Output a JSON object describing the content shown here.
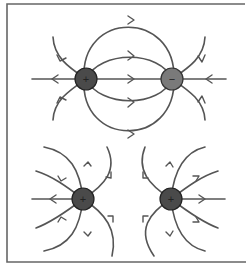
{
  "colors": {
    "line": "#555555",
    "frame": "#666666",
    "positive_charge_fill": "#4a4a4a",
    "negative_charge_fill": "#7a7a7a",
    "charge_stroke": "#222222"
  },
  "panels": [
    {
      "name": "dipole",
      "description": "Opposite charges: field lines run from positive to negative",
      "charges": [
        {
          "sign": "+",
          "label": "+",
          "x": 86,
          "y": 79
        },
        {
          "sign": "-",
          "label": "−",
          "x": 172,
          "y": 79
        }
      ]
    },
    {
      "name": "like-charges",
      "description": "Two positive charges: field lines repel away from each other",
      "charges": [
        {
          "sign": "+",
          "label": "+",
          "x": 83,
          "y": 199
        },
        {
          "sign": "+",
          "label": "+",
          "x": 171,
          "y": 199
        }
      ]
    }
  ]
}
